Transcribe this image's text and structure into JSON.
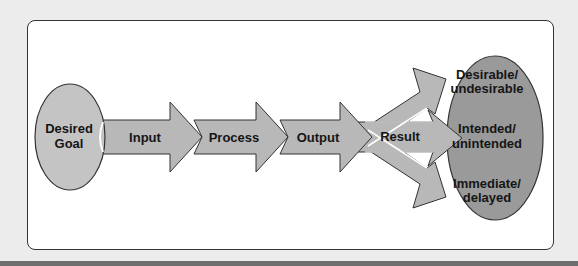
{
  "diagram": {
    "type": "process-flow",
    "start": {
      "label_line1": "Desired",
      "label_line2": "Goal"
    },
    "steps": [
      {
        "label": "Input"
      },
      {
        "label": "Process"
      },
      {
        "label": "Output"
      },
      {
        "label": "Result"
      }
    ],
    "outcomes": [
      {
        "line1": "Desirable/",
        "line2": "undesirable"
      },
      {
        "line1": "Intended/",
        "line2": "unintended"
      },
      {
        "line1": "Immediate/",
        "line2": "delayed"
      }
    ],
    "colors": {
      "background": "#ececec",
      "panel": "#ffffff",
      "start_ellipse": "#c4c4c4",
      "arrow_fill": "#b8b8b8",
      "outcome_ellipse": "#9a9a9a",
      "outline": "#333333"
    }
  }
}
